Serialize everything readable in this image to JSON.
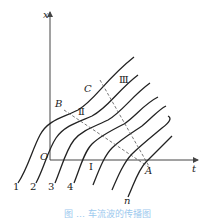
{
  "diagram": {
    "axes": {
      "x_label": "x",
      "t_label": "t",
      "origin_label": "O"
    },
    "points": {
      "A": "A",
      "B": "B",
      "C": "C"
    },
    "regions": {
      "I": "Ⅰ",
      "II": "Ⅱ",
      "III": "Ⅲ"
    },
    "curve_labels": [
      "1",
      "2",
      "3",
      "4",
      "n"
    ],
    "colors": {
      "lines": "#222222",
      "axes": "#444444",
      "caption": "#9cc9ee"
    }
  },
  "caption": "图 … 车流波的传播图"
}
